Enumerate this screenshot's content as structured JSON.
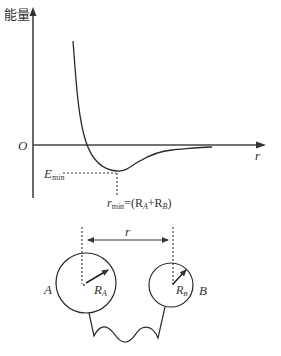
{
  "graph": {
    "y_axis_label": "能量",
    "x_axis_label": "r",
    "origin_label": "O",
    "e_min_label": {
      "main": "E",
      "sub": "min"
    },
    "r_min_label": {
      "main": "r",
      "sub": "min",
      "rest": "=(R",
      "subA": "A",
      "plus": "+R",
      "subB": "B",
      "close": ")"
    }
  },
  "model": {
    "distance_label": "r",
    "sphere_a": {
      "name": "A",
      "radius_label": "R",
      "radius_sub": "A"
    },
    "sphere_b": {
      "name": "B",
      "radius_label": "R",
      "radius_sub": "B"
    }
  },
  "colors": {
    "line": "#2a2a2a",
    "text": "#333333",
    "background": "#ffffff"
  }
}
